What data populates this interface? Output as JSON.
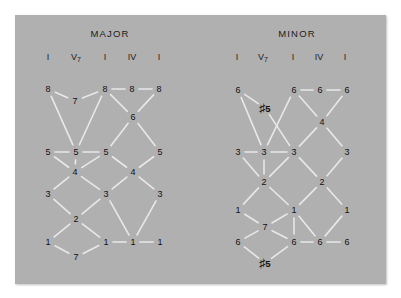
{
  "figure": {
    "background_color": "#ffffff",
    "panel_color": "#b0b0b0",
    "line_color": "#e8e8e8",
    "text_color": "#111111",
    "type": "voice-leading-diagram"
  },
  "sections": [
    {
      "id": "major",
      "title": "MAJOR",
      "title_x": 110,
      "title_y": 33,
      "chords": [
        {
          "label": "I",
          "sub": "",
          "x": 48,
          "y": 57
        },
        {
          "label": "V",
          "sub": "7",
          "x": 76,
          "y": 57
        },
        {
          "label": "I",
          "sub": "",
          "x": 105,
          "y": 57
        },
        {
          "label": "IV",
          "sub": "",
          "x": 132,
          "y": 57
        },
        {
          "label": "I",
          "sub": "",
          "x": 159,
          "y": 57
        }
      ],
      "nodes": [
        {
          "id": "m1",
          "text": "8",
          "x": 48,
          "y": 89,
          "accidental": false
        },
        {
          "id": "m2",
          "text": "7",
          "x": 75,
          "y": 101,
          "accidental": false
        },
        {
          "id": "m3",
          "text": "8",
          "x": 105,
          "y": 89,
          "accidental": false
        },
        {
          "id": "m4",
          "text": "8",
          "x": 132,
          "y": 89,
          "accidental": false
        },
        {
          "id": "m5",
          "text": "8",
          "x": 159,
          "y": 89,
          "accidental": false
        },
        {
          "id": "m6",
          "text": "6",
          "x": 133,
          "y": 117,
          "accidental": false
        },
        {
          "id": "m7",
          "text": "5",
          "x": 48,
          "y": 152,
          "accidental": false
        },
        {
          "id": "m8",
          "text": "5",
          "x": 76,
          "y": 152,
          "accidental": false
        },
        {
          "id": "m9",
          "text": "5",
          "x": 106,
          "y": 152,
          "accidental": false
        },
        {
          "id": "m10",
          "text": "5",
          "x": 160,
          "y": 152,
          "accidental": false
        },
        {
          "id": "m11",
          "text": "4",
          "x": 75,
          "y": 172,
          "accidental": false
        },
        {
          "id": "m12",
          "text": "4",
          "x": 133,
          "y": 172,
          "accidental": false
        },
        {
          "id": "m13",
          "text": "3",
          "x": 48,
          "y": 194,
          "accidental": false
        },
        {
          "id": "m14",
          "text": "3",
          "x": 106,
          "y": 194,
          "accidental": false
        },
        {
          "id": "m15",
          "text": "3",
          "x": 160,
          "y": 194,
          "accidental": false
        },
        {
          "id": "m16",
          "text": "2",
          "x": 76,
          "y": 219,
          "accidental": false
        },
        {
          "id": "m17",
          "text": "1",
          "x": 48,
          "y": 242,
          "accidental": false
        },
        {
          "id": "m18",
          "text": "1",
          "x": 106,
          "y": 242,
          "accidental": false
        },
        {
          "id": "m19",
          "text": "1",
          "x": 133,
          "y": 242,
          "accidental": false
        },
        {
          "id": "m20",
          "text": "1",
          "x": 160,
          "y": 242,
          "accidental": false
        },
        {
          "id": "m21",
          "text": "7",
          "x": 76,
          "y": 257,
          "accidental": false
        }
      ],
      "edges": [
        [
          "m1",
          "m2"
        ],
        [
          "m2",
          "m3"
        ],
        [
          "m1",
          "m8"
        ],
        [
          "m3",
          "m8"
        ],
        [
          "m3",
          "m4"
        ],
        [
          "m4",
          "m5"
        ],
        [
          "m3",
          "m6"
        ],
        [
          "m5",
          "m6"
        ],
        [
          "m6",
          "m9"
        ],
        [
          "m6",
          "m10"
        ],
        [
          "m7",
          "m8"
        ],
        [
          "m8",
          "m9"
        ],
        [
          "m7",
          "m11"
        ],
        [
          "m11",
          "m9"
        ],
        [
          "m8",
          "m11"
        ],
        [
          "m9",
          "m12"
        ],
        [
          "m10",
          "m12"
        ],
        [
          "m11",
          "m13"
        ],
        [
          "m11",
          "m14"
        ],
        [
          "m12",
          "m14"
        ],
        [
          "m12",
          "m15"
        ],
        [
          "m13",
          "m16"
        ],
        [
          "m16",
          "m14"
        ],
        [
          "m14",
          "m19"
        ],
        [
          "m15",
          "m19"
        ],
        [
          "m16",
          "m17"
        ],
        [
          "m16",
          "m18"
        ],
        [
          "m17",
          "m21"
        ],
        [
          "m21",
          "m18"
        ],
        [
          "m18",
          "m19"
        ],
        [
          "m19",
          "m20"
        ]
      ]
    },
    {
      "id": "minor",
      "title": "MINOR",
      "title_x": 297,
      "title_y": 33,
      "chords": [
        {
          "label": "I",
          "sub": "",
          "x": 237,
          "y": 57
        },
        {
          "label": "V",
          "sub": "7",
          "x": 263,
          "y": 57
        },
        {
          "label": "I",
          "sub": "",
          "x": 293,
          "y": 57
        },
        {
          "label": "IV",
          "sub": "",
          "x": 319,
          "y": 57
        },
        {
          "label": "I",
          "sub": "",
          "x": 345,
          "y": 57
        }
      ],
      "nodes": [
        {
          "id": "n1",
          "text": "6",
          "x": 238,
          "y": 90,
          "accidental": false
        },
        {
          "id": "n2",
          "text": "5",
          "x": 265,
          "y": 108,
          "accidental": true
        },
        {
          "id": "n3",
          "text": "6",
          "x": 294,
          "y": 90,
          "accidental": false
        },
        {
          "id": "n4",
          "text": "6",
          "x": 320,
          "y": 90,
          "accidental": false
        },
        {
          "id": "n5",
          "text": "6",
          "x": 347,
          "y": 90,
          "accidental": false
        },
        {
          "id": "n6",
          "text": "4",
          "x": 322,
          "y": 122,
          "accidental": false
        },
        {
          "id": "n7",
          "text": "3",
          "x": 238,
          "y": 152,
          "accidental": false
        },
        {
          "id": "n8",
          "text": "3",
          "x": 264,
          "y": 152,
          "accidental": false
        },
        {
          "id": "n9",
          "text": "3",
          "x": 294,
          "y": 152,
          "accidental": false
        },
        {
          "id": "n10",
          "text": "3",
          "x": 347,
          "y": 152,
          "accidental": false
        },
        {
          "id": "n11",
          "text": "2",
          "x": 264,
          "y": 182,
          "accidental": false
        },
        {
          "id": "n12",
          "text": "2",
          "x": 322,
          "y": 182,
          "accidental": false
        },
        {
          "id": "n13",
          "text": "1",
          "x": 238,
          "y": 210,
          "accidental": false
        },
        {
          "id": "n14",
          "text": "1",
          "x": 294,
          "y": 210,
          "accidental": false
        },
        {
          "id": "n15",
          "text": "1",
          "x": 347,
          "y": 210,
          "accidental": false
        },
        {
          "id": "n16",
          "text": "7",
          "x": 265,
          "y": 227,
          "accidental": false
        },
        {
          "id": "n17",
          "text": "6",
          "x": 238,
          "y": 242,
          "accidental": false
        },
        {
          "id": "n18",
          "text": "6",
          "x": 294,
          "y": 242,
          "accidental": false
        },
        {
          "id": "n19",
          "text": "6",
          "x": 320,
          "y": 242,
          "accidental": false
        },
        {
          "id": "n20",
          "text": "6",
          "x": 347,
          "y": 242,
          "accidental": false
        },
        {
          "id": "n21",
          "text": "5",
          "x": 265,
          "y": 263,
          "accidental": true
        }
      ],
      "edges": [
        [
          "n1",
          "n2"
        ],
        [
          "n1",
          "n8"
        ],
        [
          "n2",
          "n9"
        ],
        [
          "n8",
          "n3"
        ],
        [
          "n3",
          "n4"
        ],
        [
          "n4",
          "n5"
        ],
        [
          "n3",
          "n6"
        ],
        [
          "n5",
          "n6"
        ],
        [
          "n6",
          "n9"
        ],
        [
          "n6",
          "n10"
        ],
        [
          "n7",
          "n8"
        ],
        [
          "n8",
          "n9"
        ],
        [
          "n7",
          "n11"
        ],
        [
          "n11",
          "n9"
        ],
        [
          "n8",
          "n11"
        ],
        [
          "n9",
          "n12"
        ],
        [
          "n10",
          "n12"
        ],
        [
          "n11",
          "n13"
        ],
        [
          "n11",
          "n14"
        ],
        [
          "n12",
          "n14"
        ],
        [
          "n12",
          "n15"
        ],
        [
          "n13",
          "n16"
        ],
        [
          "n16",
          "n14"
        ],
        [
          "n14",
          "n18"
        ],
        [
          "n14",
          "n19"
        ],
        [
          "n15",
          "n19"
        ],
        [
          "n16",
          "n17"
        ],
        [
          "n16",
          "n18"
        ],
        [
          "n17",
          "n21"
        ],
        [
          "n21",
          "n18"
        ],
        [
          "n18",
          "n19"
        ],
        [
          "n19",
          "n20"
        ]
      ]
    }
  ]
}
